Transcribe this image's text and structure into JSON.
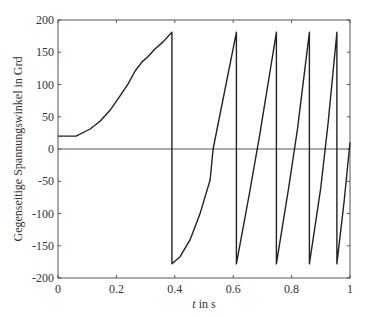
{
  "chart_data": {
    "type": "line",
    "title": "",
    "xlabel_italic": "t",
    "xlabel_rest": " in s",
    "xlabel": "t in s",
    "ylabel": "Gegenseitige Spannungswinkel in Grd",
    "xlim": [
      0,
      1
    ],
    "ylim": [
      -200,
      200
    ],
    "xticks": [
      0,
      0.2,
      0.4,
      0.6,
      0.8,
      1
    ],
    "xtick_labels": [
      "0",
      "0.2",
      "0.4",
      "0.6",
      "0.8",
      "1"
    ],
    "yticks": [
      200,
      150,
      100,
      50,
      0,
      -50,
      -100,
      -150,
      -200
    ],
    "ytick_labels": [
      "200",
      "150",
      "100",
      "50",
      "0",
      "-50",
      "-100",
      "-150",
      "-200"
    ],
    "grid": false,
    "legend": null,
    "zero_line": true,
    "line_color": "#222222",
    "series": [
      {
        "name": "Spannungswinkel",
        "x": [
          0.0,
          0.03,
          0.062,
          0.11,
          0.144,
          0.178,
          0.212,
          0.24,
          0.264,
          0.288,
          0.308,
          0.332,
          0.36,
          0.39,
          0.39,
          0.418,
          0.452,
          0.486,
          0.521,
          0.531,
          0.611,
          0.611,
          0.655,
          0.69,
          0.748,
          0.748,
          0.79,
          0.82,
          0.861,
          0.861,
          0.9,
          0.925,
          0.955,
          0.955,
          0.98,
          1.0
        ],
        "y": [
          20,
          20,
          20,
          31,
          43,
          60,
          82,
          101,
          121,
          135,
          143,
          155,
          166,
          181,
          -178,
          -167,
          -141,
          -101,
          -48,
          0,
          181,
          -178,
          -70,
          20,
          181,
          -178,
          -60,
          30,
          181,
          -178,
          -60,
          40,
          181,
          -178,
          -80,
          10
        ]
      }
    ]
  }
}
